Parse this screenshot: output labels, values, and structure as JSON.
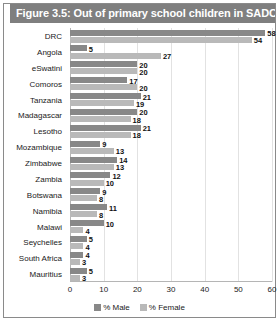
{
  "figure": {
    "title": "Figure 3.5: Out of primary school children in SADC"
  },
  "legend": {
    "items": [
      {
        "label": "% Male",
        "color": "#888888"
      },
      {
        "label": "% Female",
        "color": "#b9b9b9"
      }
    ]
  },
  "colors": {
    "title_band": "#7f7f7f",
    "male": "#888888",
    "female": "#b9b9b9",
    "grid": "#e2e2e2",
    "frame": "#8a8a8a"
  },
  "chart_data": {
    "type": "bar",
    "title": "Figure 3.5: Out of primary school children in SADC",
    "orientation": "horizontal",
    "xlabel": "",
    "ylabel": "",
    "xlim": [
      0,
      60
    ],
    "xticks": [
      0,
      10,
      20,
      30,
      40,
      50,
      60
    ],
    "grid": true,
    "legend_position": "bottom",
    "categories": [
      "DRC",
      "Angola",
      "eSwatini",
      "Comoros",
      "Tanzania",
      "Madagascar",
      "Lesotho",
      "Mozambique",
      "Zimbabwe",
      "Zambia",
      "Botswana",
      "Namibia",
      "Malawi",
      "Seychelles",
      "South Africa",
      "Mauritius"
    ],
    "series": [
      {
        "name": "% Male",
        "color": "#888888",
        "values": [
          58,
          5,
          20,
          17,
          21,
          20,
          21,
          9,
          14,
          12,
          9,
          11,
          10,
          5,
          4,
          5
        ]
      },
      {
        "name": "% Female",
        "color": "#b9b9b9",
        "values": [
          54,
          27,
          20,
          20,
          19,
          18,
          18,
          13,
          13,
          10,
          8,
          8,
          4,
          4,
          3,
          3
        ]
      }
    ]
  }
}
